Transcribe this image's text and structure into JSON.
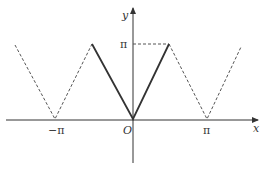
{
  "diagram": {
    "title": "",
    "axes": {
      "x_label": "x",
      "y_label": "y",
      "origin_label": "O"
    },
    "ticks": {
      "x_neg_pi": "−π",
      "x_pi": "π",
      "y_pi": "π"
    },
    "curves": {
      "solid": "y = |x| on [−π/2, π/2], reaching π at ±π/2",
      "dashed": "periodic continuation with period π"
    },
    "colors": {
      "line": "#333333",
      "dash": "#555555",
      "background": "#ffffff"
    }
  }
}
